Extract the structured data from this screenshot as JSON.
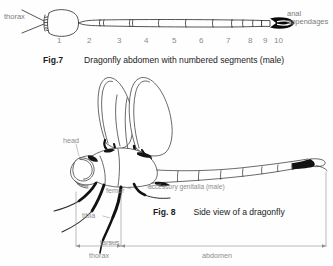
{
  "page": {
    "background_color": "#fefefe",
    "ink_color": "#2a2a2a",
    "label_color": "#8a8a8a"
  },
  "figure7": {
    "id": "fig7",
    "caption_number": "Fig.7",
    "caption_text": "Dragonfly abdomen with numbered segments (male)",
    "labels": {
      "thorax": "thorax",
      "anal_appendages_line1": "anal",
      "anal_appendages_line2": "appendages"
    },
    "segment_numbers": [
      "1",
      "2",
      "3",
      "4",
      "5",
      "6",
      "7",
      "8",
      "9",
      "10"
    ],
    "segment_number_x": [
      57,
      87,
      117,
      144,
      172,
      199,
      226,
      248,
      263,
      274
    ]
  },
  "figure8": {
    "id": "fig8",
    "caption_number": "Fig. 8",
    "caption_text": "Side view of a dragonfly",
    "labels": {
      "head": "head",
      "femur": "femur",
      "tibia": "tibia",
      "tarsus": "tarsus",
      "accessory_genitalia": "accessory genitalia (male)",
      "thorax": "thorax",
      "abdomen": "abdomen"
    },
    "measure_bars": [
      {
        "name": "thorax",
        "label": "thorax"
      },
      {
        "name": "abdomen",
        "label": "abdomen"
      }
    ]
  }
}
